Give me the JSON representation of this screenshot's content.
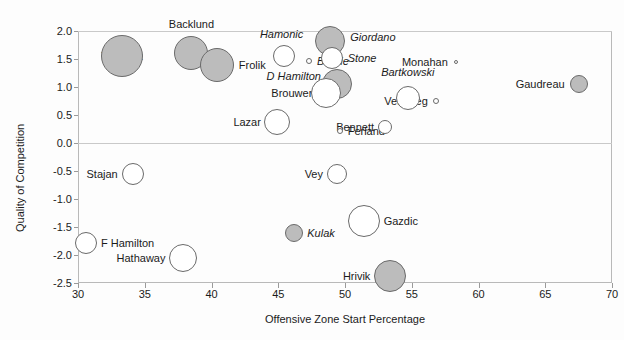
{
  "title_remnant": "",
  "axes": {
    "xlabel": "Offensive Zone Start Percentage",
    "ylabel": "Quality of Competition",
    "xticks": [
      "30",
      "35",
      "40",
      "45",
      "50",
      "55",
      "60",
      "65",
      "70"
    ],
    "yticks": [
      "2.0",
      "1.5",
      "1.0",
      "0.5",
      "0.0",
      "-0.5",
      "-1.0",
      "-1.5",
      "-2.0",
      "-2.5"
    ]
  },
  "chart_data": {
    "type": "scatter",
    "title": "",
    "xlabel": "Offensive Zone Start Percentage",
    "ylabel": "Quality of Competition",
    "xlim": [
      30,
      70
    ],
    "ylim": [
      -2.5,
      2.0
    ],
    "xticks": [
      30,
      35,
      40,
      45,
      50,
      55,
      60,
      65,
      70
    ],
    "yticks": [
      2.0,
      1.5,
      1.0,
      0.5,
      0.0,
      -0.5,
      -1.0,
      -1.5,
      -2.0,
      -2.5
    ],
    "grid": "horizontal-at-0.0-and-2.0",
    "legend": "none",
    "size_encoding": "bubble radius = time on ice",
    "color_encoding": {
      "shaded": "#bcbcbc",
      "open": "#ffffff"
    },
    "points": [
      {
        "name": "Tkachuk",
        "x": 33.3,
        "y": 1.55,
        "r": 21,
        "fill": "shaded",
        "label_pos": "center",
        "italic": false
      },
      {
        "name": "Backlund",
        "x": 38.5,
        "y": 1.6,
        "r": 17,
        "fill": "shaded",
        "label_pos": "above",
        "italic": false
      },
      {
        "name": "Frolik",
        "x": 40.4,
        "y": 1.4,
        "r": 17,
        "fill": "shaded",
        "label_pos": "right",
        "italic": false
      },
      {
        "name": "Hamonic",
        "x": 45.4,
        "y": 1.55,
        "r": 11,
        "fill": "open",
        "label_pos": "above",
        "italic": true
      },
      {
        "name": "Brodie",
        "x": 47.3,
        "y": 1.47,
        "r": 3,
        "fill": "open",
        "label_pos": "right",
        "italic": true
      },
      {
        "name": "Giordano",
        "x": 48.9,
        "y": 1.83,
        "r": 15,
        "fill": "shaded",
        "label_pos": "right",
        "italic": true
      },
      {
        "name": "Stone",
        "x": 49.0,
        "y": 1.52,
        "r": 11,
        "fill": "open",
        "label_pos": "right",
        "italic": true
      },
      {
        "name": "D Hamilton",
        "x": 49.4,
        "y": 1.05,
        "r": 15,
        "fill": "shaded",
        "label_pos": "left",
        "italic": true
      },
      {
        "name": "Brouwer",
        "x": 48.6,
        "y": 0.9,
        "r": 15,
        "fill": "open",
        "label_pos": "left",
        "italic": false
      },
      {
        "name": "Lazar",
        "x": 44.9,
        "y": 0.38,
        "r": 13,
        "fill": "open",
        "label_pos": "left",
        "italic": false
      },
      {
        "name": "Ferland",
        "x": 49.6,
        "y": 0.22,
        "r": 3,
        "fill": "open",
        "label_pos": "right",
        "italic": false
      },
      {
        "name": "Bartkowski",
        "x": 54.7,
        "y": 0.8,
        "r": 12,
        "fill": "open",
        "label_pos": "above",
        "italic": true
      },
      {
        "name": "Versteeg",
        "x": 56.8,
        "y": 0.75,
        "r": 3,
        "fill": "open",
        "label_pos": "left",
        "italic": false
      },
      {
        "name": "Monahan",
        "x": 58.3,
        "y": 1.45,
        "r": 2,
        "fill": "open",
        "label_pos": "left",
        "italic": false
      },
      {
        "name": "Bennett",
        "x": 53.0,
        "y": 0.28,
        "r": 7,
        "fill": "open",
        "label_pos": "left",
        "italic": false
      },
      {
        "name": "Gaudreau",
        "x": 67.5,
        "y": 1.05,
        "r": 9,
        "fill": "shaded",
        "label_pos": "left",
        "italic": false
      },
      {
        "name": "Stajan",
        "x": 34.1,
        "y": -0.55,
        "r": 11,
        "fill": "open",
        "label_pos": "left",
        "italic": false
      },
      {
        "name": "Vey",
        "x": 49.4,
        "y": -0.55,
        "r": 10,
        "fill": "open",
        "label_pos": "left",
        "italic": false
      },
      {
        "name": "Kulak",
        "x": 46.2,
        "y": -1.6,
        "r": 9,
        "fill": "shaded",
        "label_pos": "right",
        "italic": true
      },
      {
        "name": "Gazdic",
        "x": 51.4,
        "y": -1.4,
        "r": 16,
        "fill": "open",
        "label_pos": "right",
        "italic": false
      },
      {
        "name": "F Hamilton",
        "x": 30.6,
        "y": -1.78,
        "r": 11,
        "fill": "open",
        "label_pos": "right",
        "italic": false
      },
      {
        "name": "Hathaway",
        "x": 37.9,
        "y": -2.05,
        "r": 14,
        "fill": "open",
        "label_pos": "left",
        "italic": false
      },
      {
        "name": "Hrivik",
        "x": 53.4,
        "y": -2.37,
        "r": 16,
        "fill": "shaded",
        "label_pos": "left",
        "italic": false
      }
    ]
  }
}
